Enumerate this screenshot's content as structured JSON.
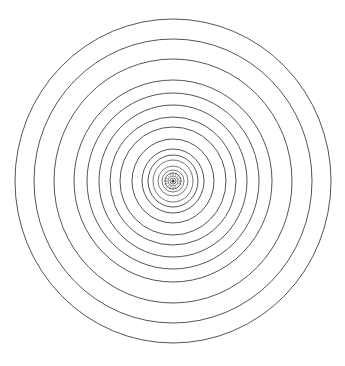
{
  "diagram": {
    "type": "concentric-circles",
    "center": [
      173,
      181
    ],
    "stroke_color": "#555555",
    "background": "#ffffff",
    "rings_rx": [
      158,
      139,
      119,
      99,
      86,
      74,
      63,
      53,
      41,
      31,
      25,
      20,
      15,
      11,
      8,
      5,
      3
    ],
    "rings_ry": [
      162,
      142,
      122,
      101,
      88,
      76,
      64,
      54,
      42,
      32,
      26,
      21,
      15,
      11,
      8,
      5,
      3
    ],
    "center_tick_count": 16
  }
}
